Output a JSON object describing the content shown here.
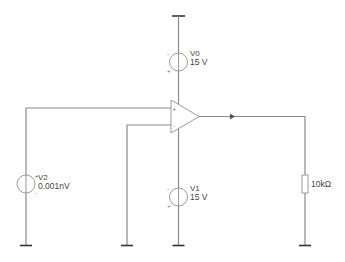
{
  "diagram": {
    "type": "circuit-schematic",
    "components": {
      "v0": {
        "name": "V0",
        "value": "15 V"
      },
      "v1": {
        "name": "V1",
        "value": "15 V"
      },
      "v2": {
        "name": "V2",
        "value": "0.001nV"
      },
      "r1": {
        "value": "10kΩ"
      },
      "opamp": {
        "plus": "+",
        "minus": "-"
      }
    },
    "signs": {
      "plus": "+",
      "minus": "-"
    },
    "colors": {
      "wire": "#8a8a8a",
      "ground": "#333333",
      "text": "#444444"
    }
  }
}
